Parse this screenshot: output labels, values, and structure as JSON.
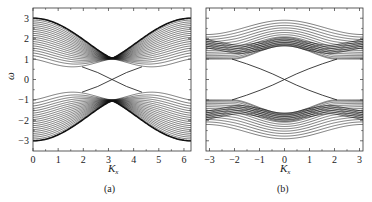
{
  "chart_data": [
    {
      "panel": "(a)",
      "type": "line",
      "title": "",
      "xlabel": "K_x",
      "ylabel": "ω",
      "xlim": [
        0,
        6.28
      ],
      "ylim": [
        -3.5,
        3.5
      ],
      "xticks": [
        0,
        1,
        2,
        3,
        4,
        5,
        6
      ],
      "yticks": [
        -3,
        -2,
        -1,
        0,
        1,
        2,
        3
      ],
      "grid": false,
      "legend": null,
      "description": "Band structure with ~20 bulk bands above and below, bulk bands touching at K_x=π, ω=±1; edge states crossing ω=0 at K_x=π",
      "series": [
        {
          "name": "upper bulk band top edge",
          "x": [
            0,
            1,
            2,
            3.14,
            4.28,
            5.28,
            6.28
          ],
          "values": [
            3.0,
            2.6,
            1.8,
            1.05,
            1.8,
            2.6,
            3.0
          ]
        },
        {
          "name": "upper bulk band bottom edge",
          "x": [
            0,
            1,
            2,
            3.14,
            4.28,
            5.28,
            6.28
          ],
          "values": [
            1.0,
            0.9,
            0.65,
            1.0,
            0.65,
            0.9,
            1.0
          ]
        },
        {
          "name": "lower bulk band top edge",
          "x": [
            0,
            1,
            2,
            3.14,
            4.28,
            5.28,
            6.28
          ],
          "values": [
            -1.0,
            -0.9,
            -0.65,
            -1.0,
            -0.65,
            -0.9,
            -1.0
          ]
        },
        {
          "name": "lower bulk band bottom edge",
          "x": [
            0,
            1,
            2,
            3.14,
            4.28,
            5.28,
            6.28
          ],
          "values": [
            -3.0,
            -2.6,
            -1.8,
            -1.05,
            -1.8,
            -2.6,
            -3.0
          ]
        },
        {
          "name": "edge state 1",
          "x": [
            2.0,
            3.14,
            4.28
          ],
          "values": [
            0.6,
            0.0,
            -0.6
          ]
        },
        {
          "name": "edge state 2",
          "x": [
            2.0,
            3.14,
            4.28
          ],
          "values": [
            -0.6,
            0.0,
            0.6
          ]
        }
      ],
      "band_count_per_side": 20
    },
    {
      "panel": "(b)",
      "type": "line",
      "title": "",
      "xlabel": "K_x",
      "ylabel": "",
      "xlim": [
        -3.14,
        3.14
      ],
      "ylim": [
        -3.5,
        3.5
      ],
      "xticks": [
        -3,
        -2,
        -1,
        0,
        1,
        2,
        3
      ],
      "yticks": [
        -3,
        -2,
        -1,
        0,
        1,
        2,
        3
      ],
      "grid": false,
      "legend": null,
      "description": "Band structure with ~14 bulk bands above and below; edge states crossing ω=0 at K_x=0",
      "series": [
        {
          "name": "upper bulk band top edge",
          "x": [
            -3.14,
            -2,
            -1,
            0,
            1,
            2,
            3.14
          ],
          "values": [
            2.2,
            2.55,
            2.8,
            2.9,
            2.8,
            2.55,
            2.2
          ]
        },
        {
          "name": "upper bulk band bottom edge",
          "x": [
            -3.14,
            -2,
            -1,
            0,
            1,
            2,
            3.14
          ],
          "values": [
            1.0,
            1.0,
            1.5,
            1.65,
            1.5,
            1.0,
            1.0
          ]
        },
        {
          "name": "lower bulk band top edge",
          "x": [
            -3.14,
            -2,
            -1,
            0,
            1,
            2,
            3.14
          ],
          "values": [
            -1.0,
            -1.0,
            -1.5,
            -1.65,
            -1.5,
            -1.0,
            -1.0
          ]
        },
        {
          "name": "lower bulk band bottom edge",
          "x": [
            -3.14,
            -2,
            -1,
            0,
            1,
            2,
            3.14
          ],
          "values": [
            -2.2,
            -2.55,
            -2.8,
            -2.9,
            -2.8,
            -2.55,
            -2.2
          ]
        },
        {
          "name": "edge state 1",
          "x": [
            -2.0,
            0,
            2.0
          ],
          "values": [
            1.0,
            0.0,
            -1.0
          ]
        },
        {
          "name": "edge state 2",
          "x": [
            -2.0,
            0,
            2.0
          ],
          "values": [
            -1.0,
            0.0,
            1.0
          ]
        }
      ],
      "band_count_per_side": 14
    }
  ],
  "panels": {
    "a": {
      "label": "(a)",
      "xlabel_main": "K",
      "xlabel_sub": "x",
      "ylabel": "ω",
      "xticks": [
        "0",
        "1",
        "2",
        "3",
        "4",
        "5",
        "6"
      ],
      "yticks": [
        "3",
        "2",
        "1",
        "0",
        "−1",
        "−2",
        "−3"
      ]
    },
    "b": {
      "label": "(b)",
      "xlabel_main": "K",
      "xlabel_sub": "x",
      "xticks": [
        "−3",
        "−2",
        "−1",
        "0",
        "1",
        "2",
        "3"
      ]
    }
  },
  "colors": {
    "line": "#111111",
    "frame": "#333333",
    "background": "#ffffff"
  }
}
